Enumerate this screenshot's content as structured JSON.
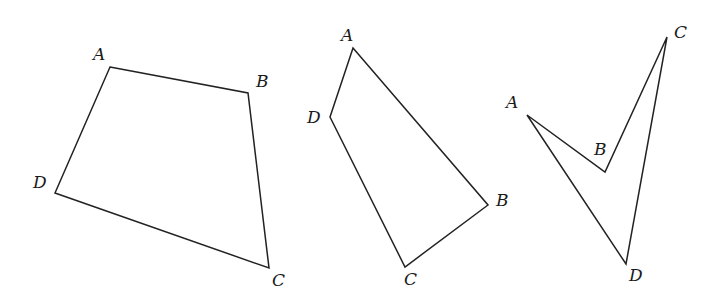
{
  "figures": [
    {
      "name": "convex-quadrilateral-1",
      "points": "110,67 248,93 269,268 55,193",
      "labels": [
        {
          "text": "A",
          "x": 93,
          "y": 60
        },
        {
          "text": "B",
          "x": 256,
          "y": 87
        },
        {
          "text": "C",
          "x": 272,
          "y": 286
        },
        {
          "text": "D",
          "x": 33,
          "y": 188
        }
      ]
    },
    {
      "name": "convex-quadrilateral-2",
      "points": "353,48 488,205 405,267 330,117",
      "labels": [
        {
          "text": "A",
          "x": 341,
          "y": 41
        },
        {
          "text": "B",
          "x": 496,
          "y": 206
        },
        {
          "text": "C",
          "x": 404,
          "y": 285
        },
        {
          "text": "D",
          "x": 307,
          "y": 123
        }
      ]
    },
    {
      "name": "concave-quadrilateral-3",
      "points": "527,115 605,172 667,37 626,264",
      "labels": [
        {
          "text": "A",
          "x": 506,
          "y": 108
        },
        {
          "text": "B",
          "x": 594,
          "y": 155
        },
        {
          "text": "C",
          "x": 674,
          "y": 38
        },
        {
          "text": "D",
          "x": 629,
          "y": 281
        }
      ]
    }
  ]
}
